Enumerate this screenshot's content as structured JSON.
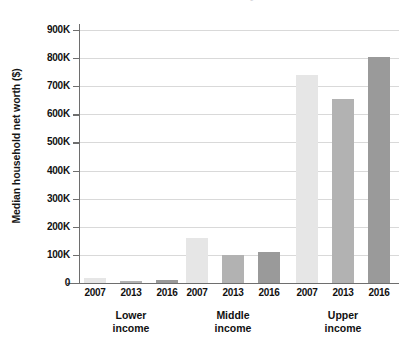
{
  "chart_data": {
    "type": "bar",
    "title": "Median household net worth by income tier",
    "title_clipped": true,
    "xlabel": "",
    "ylabel": "Median household net worth ($)",
    "ylim": [
      0,
      900000
    ],
    "ytick_labels": [
      "900K",
      "800K",
      "700K",
      "600K",
      "500K",
      "400K",
      "300K",
      "200K",
      "100K",
      "0"
    ],
    "ytick_values": [
      900000,
      800000,
      700000,
      600000,
      500000,
      400000,
      300000,
      200000,
      100000,
      0
    ],
    "grid": true,
    "legend": "none",
    "groups": [
      "Lower income",
      "Middle income",
      "Upper income"
    ],
    "group_labels": [
      {
        "line1": "Lower",
        "line2": "income"
      },
      {
        "line1": "Middle",
        "line2": "income"
      },
      {
        "line1": "Upper",
        "line2": "income"
      }
    ],
    "categories": [
      "2007",
      "2013",
      "2016"
    ],
    "series": [
      {
        "name": "2007",
        "color": "#e6e6e6",
        "values": [
          18000,
          160000,
          740000
        ]
      },
      {
        "name": "2013",
        "color": "#b2b2b2",
        "values": [
          8000,
          100000,
          655000
        ]
      },
      {
        "name": "2016",
        "color": "#9a9a9a",
        "values": [
          11000,
          110000,
          805000
        ]
      }
    ],
    "bars": [
      {
        "group": "Lower income",
        "year": "2007",
        "value": 18000,
        "color": "#e6e6e6"
      },
      {
        "group": "Lower income",
        "year": "2013",
        "value": 8000,
        "color": "#b2b2b2"
      },
      {
        "group": "Lower income",
        "year": "2016",
        "value": 11000,
        "color": "#9a9a9a"
      },
      {
        "group": "Middle income",
        "year": "2007",
        "value": 160000,
        "color": "#e6e6e6"
      },
      {
        "group": "Middle income",
        "year": "2013",
        "value": 100000,
        "color": "#b2b2b2"
      },
      {
        "group": "Middle income",
        "year": "2016",
        "value": 110000,
        "color": "#9a9a9a"
      },
      {
        "group": "Upper income",
        "year": "2007",
        "value": 740000,
        "color": "#e6e6e6"
      },
      {
        "group": "Upper income",
        "year": "2013",
        "value": 655000,
        "color": "#b2b2b2"
      },
      {
        "group": "Upper income",
        "year": "2016",
        "value": 805000,
        "color": "#9a9a9a"
      }
    ],
    "xtick_labels": [
      "2007",
      "2013",
      "2016",
      "2007",
      "2013",
      "2016",
      "2007",
      "2013",
      "2016"
    ],
    "colors": {
      "background": "#ffffff",
      "axis": "#6e6e6e",
      "gridline": "#d9d9d9",
      "text": "#111111"
    }
  }
}
